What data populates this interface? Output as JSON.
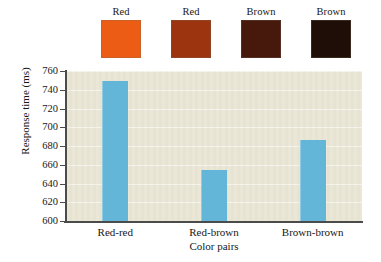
{
  "chart_data": {
    "type": "bar",
    "title": "",
    "xlabel": "Color pairs",
    "ylabel": "Response time (ms)",
    "categories": [
      "Red-red",
      "Red-brown",
      "Brown-brown"
    ],
    "values": [
      749,
      654,
      686
    ],
    "ylim": [
      600,
      760
    ],
    "yticks": [
      600,
      620,
      640,
      660,
      680,
      700,
      720,
      740,
      760
    ],
    "ytick_labels": [
      "600",
      "620",
      "640",
      "660",
      "680",
      "700",
      "720",
      "740",
      "760"
    ],
    "grid": true,
    "legend": "none",
    "bar_color": "#63b6d7",
    "plot_background": "#e9e6d4",
    "axis_color": "#4b4b4b"
  },
  "swatches": {
    "items": [
      {
        "label": "Red",
        "color": "#ed5c15"
      },
      {
        "label": "Red",
        "color": "#9c3410"
      },
      {
        "label": "Brown",
        "color": "#47180c"
      },
      {
        "label": "Brown",
        "color": "#1f0d08"
      }
    ]
  }
}
